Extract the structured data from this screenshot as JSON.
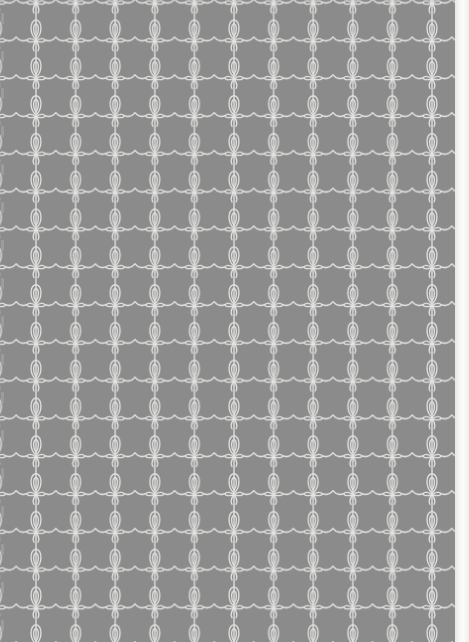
{
  "image": {
    "description": "Gray patterned paper with white ornamental scroll motifs arranged in a grid",
    "width": 469,
    "height": 642
  },
  "pattern": {
    "background_color": "#8b8b8b",
    "line_color": "#e4e4e2",
    "paper_color": "#f3f3f1",
    "tile_width": 39.6,
    "tile_height": 37.8,
    "origin_x": 36,
    "origin_y": 3.5,
    "columns": 12,
    "rows": 18,
    "printed_area_width": 457,
    "motif": "vertical stem with teardrop loop above a knot, two small side loops, scalloped wave linking horizontally"
  },
  "left_edge_marks": [
    13,
    51,
    88,
    126,
    164,
    202,
    240,
    278,
    316,
    354,
    392,
    430,
    468,
    506,
    544,
    582,
    620
  ]
}
